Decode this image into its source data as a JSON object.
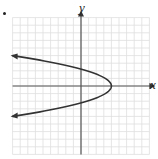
{
  "chart_data": {
    "type": "line",
    "title": "",
    "xlabel": "x",
    "ylabel": "y",
    "equation_estimate": "x = 4 - 0.8 y^2 (sideways parabola opening left)",
    "vertex": [
      4,
      0
    ],
    "y_intercepts": [
      2.3,
      -2.3
    ],
    "xlim": [
      -9,
      9
    ],
    "ylim": [
      -9,
      9
    ],
    "grid": true,
    "series": [
      {
        "name": "parabola",
        "points": [
          [
            -9,
            4
          ],
          [
            -5,
            3.3
          ],
          [
            0,
            2.3
          ],
          [
            2,
            1.6
          ],
          [
            3.5,
            0.8
          ],
          [
            4,
            0
          ],
          [
            3.5,
            -0.8
          ],
          [
            2,
            -1.6
          ],
          [
            0,
            -2.3
          ],
          [
            -5,
            -3.3
          ],
          [
            -9,
            -4
          ]
        ]
      }
    ],
    "arrows_on_ends": true
  },
  "labels": {
    "x_axis": "x",
    "y_axis": "y"
  },
  "colors": {
    "grid": "#dddddd",
    "axis": "#555555",
    "curve": "#333333"
  }
}
